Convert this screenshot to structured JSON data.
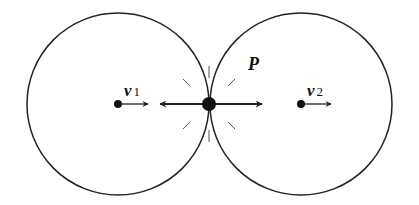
{
  "diagram": {
    "type": "two tangent circles with contact point",
    "stroke_color": "#222222",
    "background": "#ffffff",
    "circles": [
      {
        "name": "left-circle",
        "cx": 118,
        "cy": 104,
        "r": 91
      },
      {
        "name": "right-circle",
        "cx": 301,
        "cy": 104,
        "r": 91
      }
    ],
    "contact_point": {
      "label": "P",
      "x": 209,
      "y": 104
    },
    "centers": [
      {
        "label_main": "v",
        "label_sub": "1",
        "x": 118,
        "y": 104
      },
      {
        "label_main": "v",
        "label_sub": "2",
        "x": 301,
        "y": 104
      }
    ],
    "arrows": [
      {
        "name": "v1-velocity",
        "from": [
          118,
          104
        ],
        "to": [
          148,
          104
        ]
      },
      {
        "name": "v2-velocity",
        "from": [
          301,
          104
        ],
        "to": [
          331,
          104
        ]
      },
      {
        "name": "force-left",
        "from": [
          209,
          104
        ],
        "to": [
          160,
          104
        ]
      },
      {
        "name": "force-right",
        "from": [
          209,
          104
        ],
        "to": [
          262,
          104
        ]
      }
    ],
    "labels": {
      "v1_main": "v",
      "v1_sub": "1",
      "v2_main": "v",
      "v2_sub": "2",
      "point": "P"
    }
  }
}
